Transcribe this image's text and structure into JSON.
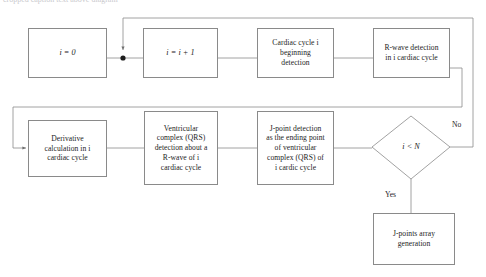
{
  "figure": {
    "title_fragment": "cropped caption text above diagram",
    "type": "flowchart",
    "line_color": "#8a8a8a",
    "text_color": "#1d1d1d",
    "background": "#ffffff"
  },
  "nodes": [
    {
      "id": "init",
      "label": "i = 0"
    },
    {
      "id": "increment",
      "label": "i = i + 1"
    },
    {
      "id": "cycle_begin",
      "label": "Cardiac cycle i\nbeginning\ndetection"
    },
    {
      "id": "rwave",
      "label": "R-wave detection\nin i cardiac cycle"
    },
    {
      "id": "derivative",
      "label": "Derivative\ncalculation in i\ncardiac cycle"
    },
    {
      "id": "qrs",
      "label": "Ventricular\ncomplex (QRS)\ndetection about a\nR-wave of i\ncardiac cycle"
    },
    {
      "id": "jpoint",
      "label": "J-point detection\nas the ending point\nof ventricular\ncomplex (QRS) of\ni cardic cycle"
    },
    {
      "id": "jarray",
      "label": "J-points array\ngeneration"
    }
  ],
  "decision": {
    "id": "loop_test",
    "label": "i < N",
    "branch_no": "No",
    "branch_yes": "Yes"
  }
}
